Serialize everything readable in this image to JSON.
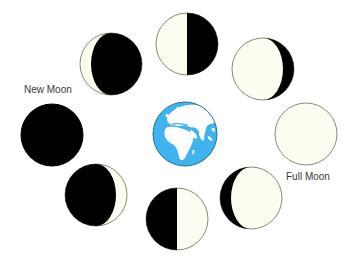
{
  "diagram": {
    "type": "moon-phases",
    "center_object": "Earth",
    "colors": {
      "background": "#FFFFFF",
      "moon_lit": "#FDFCF0",
      "moon_dark": "#000000",
      "moon_outline": "#8A8A80",
      "earth_ocean": "#3FB3EE",
      "earth_land": "#FFFFFF",
      "earth_outline": "#2A6E99",
      "label_text": "#3A3A3A"
    },
    "labels": {
      "new_moon": "New Moon",
      "full_moon": "Full Moon"
    },
    "earth": {
      "cx": 185,
      "cy": 134,
      "r": 32
    },
    "moons": [
      {
        "id": "new-moon",
        "phase": "New Moon",
        "cx": 52,
        "cy": 135,
        "r": 31,
        "lit": "none"
      },
      {
        "id": "waning-crescent",
        "phase": "Crescent (lit left)",
        "cx": 111,
        "cy": 64,
        "r": 31,
        "lit": "left-crescent"
      },
      {
        "id": "last-quarter",
        "phase": "Half (lit left)",
        "cx": 187,
        "cy": 44,
        "r": 31,
        "lit": "left-half"
      },
      {
        "id": "waning-gibbous",
        "phase": "Gibbous (lit left)",
        "cx": 263,
        "cy": 69,
        "r": 31,
        "lit": "left-gibbous"
      },
      {
        "id": "full-moon",
        "phase": "Full Moon",
        "cx": 306,
        "cy": 134,
        "r": 31,
        "lit": "full"
      },
      {
        "id": "waxing-gibbous",
        "phase": "Gibbous (lit right)",
        "cx": 251,
        "cy": 198,
        "r": 31,
        "lit": "right-gibbous"
      },
      {
        "id": "first-quarter",
        "phase": "Half (lit right)",
        "cx": 177,
        "cy": 219,
        "r": 31,
        "lit": "right-half"
      },
      {
        "id": "waxing-crescent",
        "phase": "Crescent (lit right)",
        "cx": 96,
        "cy": 195,
        "r": 31,
        "lit": "right-crescent"
      }
    ]
  }
}
